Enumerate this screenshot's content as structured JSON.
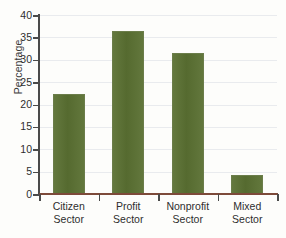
{
  "chart_data": {
    "type": "bar",
    "title": "",
    "xlabel": "",
    "ylabel": "Percentage",
    "categories": [
      "Citizen Sector",
      "Profit Sector",
      "Nonprofit Sector",
      "Mixed Sector"
    ],
    "category_lines": [
      [
        "Citizen",
        "Sector"
      ],
      [
        "Profit",
        "Sector"
      ],
      [
        "Nonprofit",
        "Sector"
      ],
      [
        "Mixed",
        "Sector"
      ]
    ],
    "values": [
      22.3,
      36.4,
      31.5,
      4.2
    ],
    "ylim": [
      0,
      40
    ],
    "yticks": [
      0,
      5,
      10,
      15,
      20,
      25,
      30,
      35,
      40
    ],
    "ytick_labels": [
      "0",
      "5",
      "10",
      "15",
      "20",
      "25",
      "30",
      "35",
      "40"
    ],
    "grid": true,
    "legend": "none",
    "bar_color": "#5a7032",
    "axis_color": "#4a4a4a",
    "baseline_color": "#7d4a3a",
    "gridline_color": "#e9ebee"
  }
}
